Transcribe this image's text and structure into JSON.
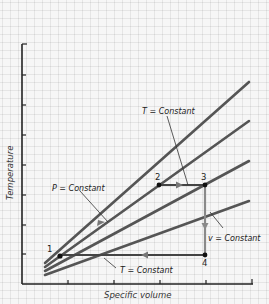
{
  "diagram": {
    "y_axis_label": "Temperature",
    "x_axis_label": "Specific volume",
    "labels": {
      "p_constant": "P = Constant",
      "t_constant_top": "T = Constant",
      "t_constant_bottom": "T = Constant",
      "v_constant": "v = Constant"
    },
    "points": [
      {
        "id": "1",
        "label": "1"
      },
      {
        "id": "2",
        "label": "2"
      },
      {
        "id": "3",
        "label": "3"
      },
      {
        "id": "4",
        "label": "4"
      }
    ],
    "colors": {
      "isobar_line": "#555555",
      "process_path": "#444444",
      "v_path": "#8a8a8a",
      "axis": "#222222",
      "background": "#f6f6f6"
    }
  }
}
